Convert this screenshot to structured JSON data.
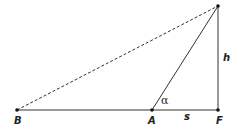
{
  "diagram": {
    "type": "geometry-triangle",
    "points": {
      "B": {
        "label": "B",
        "x": 17,
        "y": 110
      },
      "A": {
        "label": "A",
        "x": 152,
        "y": 110
      },
      "F": {
        "label": "F",
        "x": 218,
        "y": 110
      },
      "T": {
        "label": "",
        "x": 218,
        "y": 6
      }
    },
    "segments": [
      {
        "from": "B",
        "to": "F",
        "style": "solid"
      },
      {
        "from": "A",
        "to": "T",
        "style": "solid"
      },
      {
        "from": "F",
        "to": "T",
        "style": "solid"
      },
      {
        "from": "B",
        "to": "T",
        "style": "dashed"
      }
    ],
    "labels": {
      "B": "B",
      "A": "A",
      "F": "F",
      "s": "s",
      "h": "h",
      "alpha": "α"
    },
    "colors": {
      "line": "#333333",
      "point": "#111111",
      "background": "#ffffff"
    }
  }
}
